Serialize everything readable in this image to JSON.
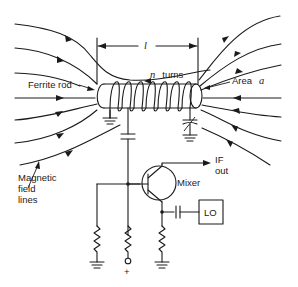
{
  "diagram": {
    "labels": {
      "ferrite_rod": "Ferrite rod",
      "n_turns_var": "n",
      "n_turns_text": "turns",
      "length_var": "l",
      "area_text": "Area",
      "area_var": "a",
      "magnetic_line1": "Magnetic",
      "magnetic_line2": "field",
      "magnetic_line3": "lines",
      "mixer": "Mixer",
      "if_line1": "IF",
      "if_line2": "out",
      "lo": "LO",
      "plus": "+"
    },
    "components": [
      "ferrite-rod",
      "coil",
      "variable-capacitor",
      "coupling-capacitor",
      "bjt-transistor",
      "bias-resistor-ground",
      "bias-resistor-supply",
      "emitter-resistor",
      "lo-coupling-capacitor",
      "local-oscillator"
    ],
    "colors": {
      "ink": "#1a1a1a",
      "background": "#ffffff"
    }
  }
}
